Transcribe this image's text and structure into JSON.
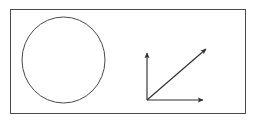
{
  "figure": {
    "background_color": "#ffffff",
    "border_color": "#4a4a4a",
    "line_color": "#555555",
    "text_color": "#101010",
    "frame": {
      "x": 10,
      "y": 9,
      "width": 236,
      "height": 105
    }
  },
  "beam_spot": {
    "name": "hatched-circle",
    "center_x": 63.5,
    "center_y": 60,
    "radius_x": 41.5,
    "radius_y": 43,
    "hatch_line_count": 13,
    "hatch_spacing": 6,
    "hatch_orientation": "horizontal",
    "hatch_overhang": 7
  },
  "vectors": {
    "origin_x": 147,
    "origin_y": 100,
    "items": [
      {
        "id": "e-o",
        "label_base": "E",
        "label_sub": "O",
        "tip_x": 147,
        "tip_y": 53,
        "direction": "vertical-up"
      },
      {
        "id": "e-tr",
        "label_base": "E",
        "label_sub": "TR",
        "tip_x": 206,
        "tip_y": 49,
        "direction": "diagonal-up-right"
      },
      {
        "id": "e-p",
        "label_base": "E",
        "label_sub": "P",
        "tip_x": 203,
        "tip_y": 100,
        "direction": "horizontal-right"
      }
    ]
  }
}
